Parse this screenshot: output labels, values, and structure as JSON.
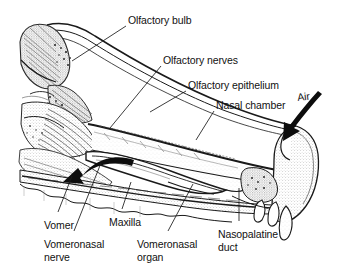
{
  "figure": {
    "background_color": "#ffffff",
    "ink_color": "#1a1a1a",
    "stipple_color": "#bdbdbd"
  },
  "labels": [
    {
      "id": "olfactory-bulb",
      "text": "Olfactory bulb",
      "x": 128,
      "y": 14
    },
    {
      "id": "olfactory-nerves",
      "text": "Olfactory nerves",
      "x": 163,
      "y": 54
    },
    {
      "id": "olfactory-epithelium",
      "text": "Olfactory epithelium",
      "x": 188,
      "y": 79
    },
    {
      "id": "nasal-chamber",
      "text": "Nasal chamber",
      "x": 216,
      "y": 99
    },
    {
      "id": "air",
      "text": "Air",
      "x": 298,
      "y": 91
    },
    {
      "id": "vomer",
      "text": "Vomer",
      "x": 44,
      "y": 219
    },
    {
      "id": "vomeronasal-nerve",
      "text": "Vomeronasal\nnerve",
      "x": 44,
      "y": 238
    },
    {
      "id": "maxilla",
      "text": "Maxilla",
      "x": 109,
      "y": 216
    },
    {
      "id": "vomeronasal-organ",
      "text": "Vomeronasal\norgan",
      "x": 137,
      "y": 238
    },
    {
      "id": "nasopalatine-duct",
      "text": "Nasopalatine\nduct",
      "x": 218,
      "y": 228
    }
  ],
  "annotations": {
    "air_arrow": "thick arrow pointing down-left into the external naris",
    "flow_arrow": "thick curved arrow pointing left toward the vomeronasal organ"
  },
  "leader_lines": [
    {
      "from": "olfactory-bulb",
      "x1": 126,
      "y1": 26,
      "x2": 72,
      "y2": 61
    },
    {
      "from": "olfactory-nerves",
      "x1": 161,
      "y1": 66,
      "x2": 110,
      "y2": 128
    },
    {
      "from": "olfactory-epithelium",
      "x1": 186,
      "y1": 91,
      "x2": 150,
      "y2": 112
    },
    {
      "from": "nasal-chamber",
      "x1": 214,
      "y1": 111,
      "x2": 196,
      "y2": 140
    },
    {
      "from": "vomer",
      "x1": 58,
      "y1": 212,
      "x2": 72,
      "y2": 176
    },
    {
      "from": "vomeronasal-nerve",
      "x1": 74,
      "y1": 231,
      "x2": 101,
      "y2": 163
    },
    {
      "from": "maxilla",
      "x1": 122,
      "y1": 209,
      "x2": 131,
      "y2": 182
    },
    {
      "from": "vomeronasal-organ",
      "x1": 168,
      "y1": 231,
      "x2": 193,
      "y2": 184
    },
    {
      "from": "nasopalatine-duct",
      "x1": 239,
      "y1": 221,
      "x2": 239,
      "y2": 188
    }
  ]
}
